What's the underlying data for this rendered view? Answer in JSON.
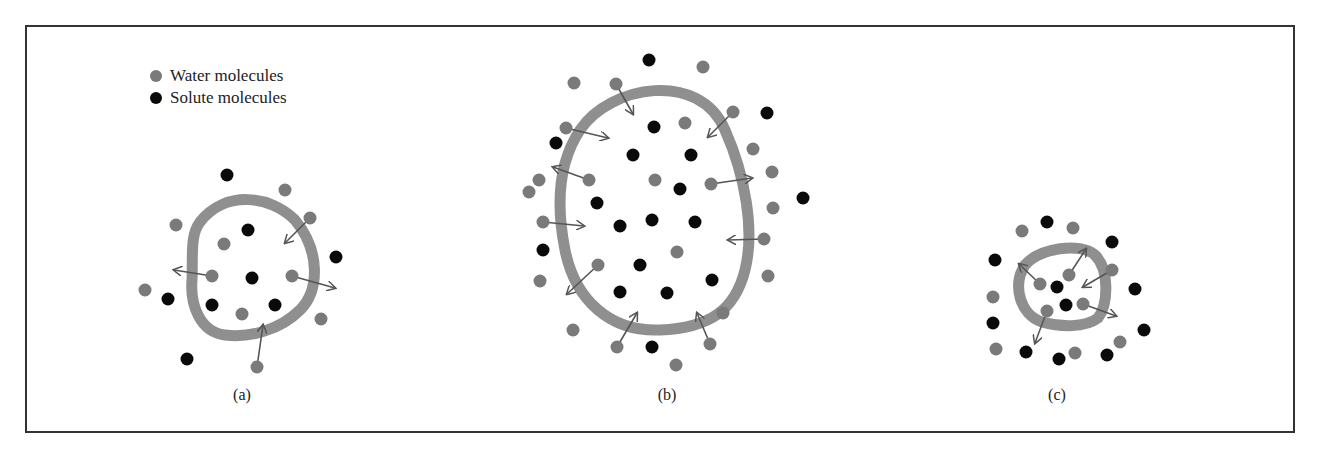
{
  "colors": {
    "water": "#7a7a7a",
    "solute": "#0a0a0a",
    "membrane": "#8f8f8f",
    "arrow": "#555555",
    "border": "#333333"
  },
  "legend": {
    "items": [
      {
        "label": "Water molecules",
        "type": "water"
      },
      {
        "label": "Solute molecules",
        "type": "solute"
      }
    ]
  },
  "panels": [
    {
      "label": "(a)",
      "label_x": 242,
      "label_y": 386,
      "membrane_path": "M 200 222 C 225 190, 270 195, 295 220 C 320 250, 320 290, 300 310 C 280 330, 250 338, 225 335 C 200 332, 190 305, 192 280 C 193 255, 190 235, 200 222 Z",
      "water": [
        [
          285,
          190
        ],
        [
          176,
          225
        ],
        [
          310,
          218
        ],
        [
          224,
          244
        ],
        [
          212,
          276
        ],
        [
          292,
          276
        ],
        [
          145,
          290
        ],
        [
          242,
          314
        ],
        [
          321,
          319
        ],
        [
          257,
          367
        ]
      ],
      "solute": [
        [
          227,
          175
        ],
        [
          248,
          230
        ],
        [
          336,
          257
        ],
        [
          252,
          278
        ],
        [
          168,
          299
        ],
        [
          212,
          305
        ],
        [
          275,
          305
        ],
        [
          187,
          359
        ]
      ],
      "arrows": [
        [
          310,
          218,
          285,
          243
        ],
        [
          212,
          276,
          174,
          270
        ],
        [
          292,
          276,
          335,
          288
        ],
        [
          257,
          367,
          263,
          325
        ]
      ]
    },
    {
      "label": "(b)",
      "label_x": 667,
      "label_y": 386,
      "membrane_path": "M 580 130 C 610 85, 700 70, 725 130 C 745 175, 755 230, 745 270 C 735 310, 710 328, 660 330 C 610 332, 575 300, 565 250 C 555 200, 560 160, 580 130 Z",
      "water": [
        [
          574,
          83
        ],
        [
          616,
          84
        ],
        [
          703,
          67
        ],
        [
          733,
          112
        ],
        [
          566,
          128
        ],
        [
          685,
          123
        ],
        [
          753,
          149
        ],
        [
          539,
          180
        ],
        [
          589,
          180
        ],
        [
          655,
          180
        ],
        [
          711,
          184
        ],
        [
          772,
          172
        ],
        [
          529,
          192
        ],
        [
          543,
          222
        ],
        [
          773,
          208
        ],
        [
          764,
          239
        ],
        [
          677,
          252
        ],
        [
          598,
          265
        ],
        [
          540,
          281
        ],
        [
          768,
          276
        ],
        [
          723,
          313
        ],
        [
          573,
          330
        ],
        [
          617,
          347
        ],
        [
          710,
          344
        ],
        [
          676,
          365
        ]
      ],
      "solute": [
        [
          649,
          60
        ],
        [
          767,
          113
        ],
        [
          654,
          127
        ],
        [
          556,
          143
        ],
        [
          633,
          155
        ],
        [
          691,
          155
        ],
        [
          680,
          189
        ],
        [
          597,
          203
        ],
        [
          803,
          198
        ],
        [
          620,
          226
        ],
        [
          652,
          220
        ],
        [
          695,
          222
        ],
        [
          543,
          250
        ],
        [
          640,
          265
        ],
        [
          712,
          280
        ],
        [
          620,
          292
        ],
        [
          667,
          293
        ],
        [
          652,
          347
        ]
      ],
      "arrows": [
        [
          616,
          84,
          633,
          114
        ],
        [
          733,
          112,
          708,
          137
        ],
        [
          566,
          128,
          608,
          138
        ],
        [
          589,
          180,
          553,
          167
        ],
        [
          711,
          184,
          752,
          178
        ],
        [
          543,
          222,
          584,
          226
        ],
        [
          764,
          239,
          728,
          240
        ],
        [
          598,
          265,
          567,
          294
        ],
        [
          617,
          347,
          637,
          313
        ],
        [
          710,
          344,
          697,
          313
        ]
      ]
    },
    {
      "label": "(c)",
      "label_x": 1057,
      "label_y": 386,
      "membrane_path": "M 1025 265 C 1040 248, 1080 242, 1095 255 C 1110 270, 1108 305, 1098 318 C 1085 328, 1060 327, 1042 322 C 1020 315, 1012 285, 1025 265 Z",
      "water": [
        [
          1022,
          231
        ],
        [
          1073,
          228
        ],
        [
          1112,
          270
        ],
        [
          1069,
          275
        ],
        [
          993,
          297
        ],
        [
          1040,
          284
        ],
        [
          1047,
          311
        ],
        [
          1083,
          304
        ],
        [
          1120,
          342
        ],
        [
          996,
          349
        ],
        [
          1075,
          353
        ]
      ],
      "solute": [
        [
          1047,
          222
        ],
        [
          1112,
          242
        ],
        [
          995,
          260
        ],
        [
          1057,
          287
        ],
        [
          1066,
          305
        ],
        [
          1135,
          289
        ],
        [
          993,
          323
        ],
        [
          1144,
          330
        ],
        [
          1026,
          352
        ],
        [
          1059,
          359
        ],
        [
          1107,
          355
        ]
      ],
      "arrows": [
        [
          1040,
          284,
          1019,
          264
        ],
        [
          1069,
          275,
          1086,
          249
        ],
        [
          1112,
          270,
          1083,
          287
        ],
        [
          1083,
          304,
          1116,
          316
        ],
        [
          1047,
          311,
          1035,
          343
        ]
      ]
    }
  ]
}
